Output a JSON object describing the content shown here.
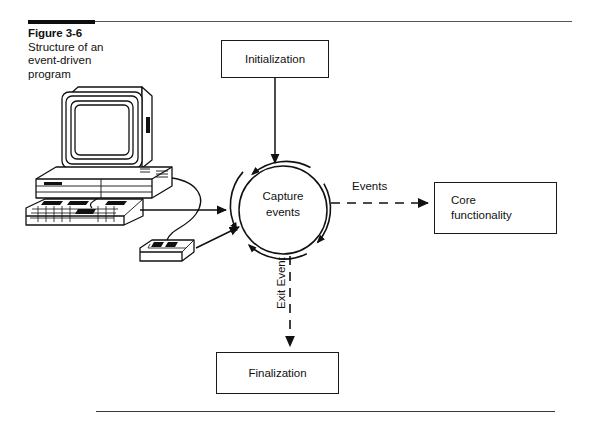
{
  "figure": {
    "caption_title": "Figure 3-6",
    "caption_body": "Structure of  an event-driven program",
    "page_background": "#ffffff",
    "ink_color": "#111111"
  },
  "diagram": {
    "nodes": [
      {
        "id": "initialization",
        "label": "Initialization",
        "shape": "rectangle"
      },
      {
        "id": "capture-events",
        "label": "Capture\nevents",
        "shape": "circle"
      },
      {
        "id": "core-functionality",
        "label": "Core\nfunctionality",
        "shape": "rectangle"
      },
      {
        "id": "finalization",
        "label": "Finalization",
        "shape": "rectangle"
      }
    ],
    "edges": [
      {
        "id": "init-to-capture",
        "from": "initialization",
        "to": "capture-events",
        "label": "",
        "style": "solid"
      },
      {
        "id": "capture-to-core",
        "from": "capture-events",
        "to": "core-functionality",
        "label": "Events",
        "style": "dashed"
      },
      {
        "id": "capture-to-finalization",
        "from": "capture-events",
        "to": "finalization",
        "label": "Exit Event",
        "style": "dashed"
      },
      {
        "id": "keyboard-to-capture",
        "from": "computer",
        "to": "capture-events",
        "label": "",
        "style": "solid"
      },
      {
        "id": "mouse-to-capture",
        "from": "mouse",
        "to": "capture-events",
        "label": "",
        "style": "solid"
      }
    ],
    "illustration": {
      "name": "desktop-computer",
      "parts": [
        "crt-monitor",
        "system-unit",
        "keyboard",
        "mouse",
        "cable"
      ]
    },
    "labels": {
      "events": "Events",
      "exit_event": "Exit Event"
    }
  }
}
